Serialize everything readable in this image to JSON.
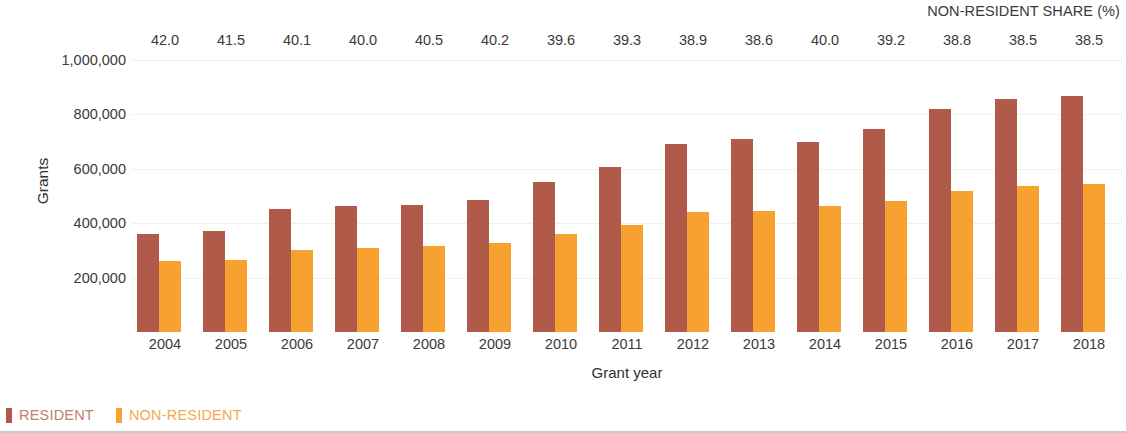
{
  "chart_data": {
    "type": "bar",
    "title": "",
    "xlabel": "Grant year",
    "ylabel": "Grants",
    "ylim": [
      0,
      1000000
    ],
    "yticks": [
      "200,000",
      "400,000",
      "600,000",
      "800,000",
      "1,000,000"
    ],
    "ytick_values": [
      200000,
      400000,
      600000,
      800000,
      1000000
    ],
    "grid": true,
    "legend_position": "bottom-left",
    "categories": [
      "2004",
      "2005",
      "2006",
      "2007",
      "2008",
      "2009",
      "2010",
      "2011",
      "2012",
      "2013",
      "2014",
      "2015",
      "2016",
      "2017",
      "2018"
    ],
    "series": [
      {
        "name": "RESIDENT",
        "color": "#b05a49",
        "values": [
          361000,
          371000,
          452000,
          463000,
          466000,
          486000,
          553000,
          608000,
          692000,
          708000,
          698000,
          747000,
          819000,
          855000,
          868000
        ]
      },
      {
        "name": "NON-RESIDENT",
        "color": "#f7a130",
        "values": [
          261000,
          263000,
          303000,
          309000,
          317000,
          327000,
          362000,
          394000,
          440000,
          445000,
          465000,
          482000,
          520000,
          535000,
          543000
        ]
      }
    ],
    "secondary_axis": {
      "label": "NON-RESIDENT SHARE (%)",
      "values": [
        "42.0",
        "41.5",
        "40.1",
        "40.0",
        "40.5",
        "40.2",
        "39.6",
        "39.3",
        "38.9",
        "38.6",
        "40.0",
        "39.2",
        "38.8",
        "38.5",
        "38.5"
      ]
    }
  },
  "legend": [
    {
      "label": "RESIDENT",
      "color": "#b05a49",
      "text_color": "#c08070"
    },
    {
      "label": "NON-RESIDENT",
      "color": "#f7a130",
      "text_color": "#f4aa4d"
    }
  ]
}
